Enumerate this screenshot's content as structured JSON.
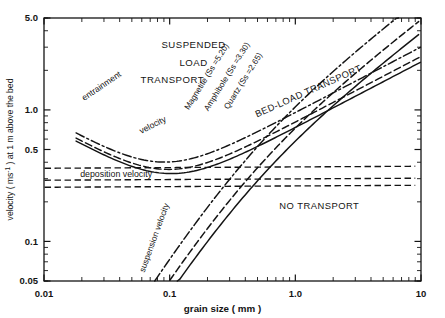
{
  "chart_data": {
    "type": "line",
    "title": "",
    "xlabel": "grain  size  ( mm )",
    "ylabel": "velocity ( ms⁻¹ ) at 1 m above the bed",
    "xscale": "log",
    "yscale": "log",
    "xlim": [
      0.01,
      10
    ],
    "ylim": [
      0.05,
      5.0
    ],
    "xticks": [
      "0.01",
      "0.1",
      "1.0",
      "10"
    ],
    "xtick_values": [
      0.01,
      0.1,
      1.0,
      10
    ],
    "yticks": [
      "5.0",
      "1.0",
      "0.5",
      "0.1",
      "0.05"
    ],
    "ytick_values": [
      5.0,
      1.0,
      0.5,
      0.1,
      0.05
    ],
    "grid": false,
    "legend": "none",
    "annotations": [
      {
        "text": "SUSPENDED",
        "x": 0.17,
        "y": 3.1
      },
      {
        "text": "LOAD",
        "x": 0.17,
        "y": 2.35
      },
      {
        "text": "TRANSPORT",
        "x": 0.11,
        "y": 1.8
      },
      {
        "text": "BED-LOAD TRANSPORT",
        "x": 1.4,
        "y": 1.25
      },
      {
        "text": "NO TRANSPORT",
        "x": 1.5,
        "y": 0.175
      },
      {
        "text": "entrainment",
        "x": 0.026,
        "y": 1.35
      },
      {
        "text": "velocity",
        "x": 0.062,
        "y": 0.72
      },
      {
        "text": "deposition   velocity",
        "x": 0.022,
        "y": 0.3
      },
      {
        "text": "suspension  velocity",
        "x": 0.072,
        "y": 0.105
      }
    ],
    "series": [
      {
        "name": "Magnetite (Ss = 5.20)",
        "label": "Magnetite (Ss =5.20)",
        "style": "dash-dot",
        "kind": "suspension"
      },
      {
        "name": "Amphibole (Ss = 3.30)",
        "label": "Amphibole (Ss =3.30)",
        "style": "dashed",
        "kind": "suspension"
      },
      {
        "name": "Quartz (Ss = 2.65)",
        "label": "Quartz (Ss =2.65)",
        "style": "solid",
        "kind": "suspension"
      },
      {
        "name": "entrainment velocity - magnetite",
        "style": "dash-dot",
        "kind": "entrainment"
      },
      {
        "name": "entrainment velocity - amphibole",
        "style": "dashed",
        "kind": "entrainment"
      },
      {
        "name": "entrainment velocity - quartz",
        "style": "solid",
        "kind": "entrainment"
      },
      {
        "name": "deposition velocity - magnetite",
        "style": "dash-dot",
        "kind": "deposition",
        "y": 0.36
      },
      {
        "name": "deposition velocity - amphibole",
        "style": "dashed",
        "kind": "deposition",
        "y": 0.29
      },
      {
        "name": "deposition velocity - quartz",
        "style": "solid-dashed",
        "kind": "deposition",
        "y": 0.255
      }
    ],
    "curve_labels": [
      {
        "text": "Magnetite (Ss =5.20)",
        "x": 0.195,
        "y": 1.9
      },
      {
        "text": "Amphibole (Ss =3.30)",
        "x": 0.28,
        "y": 1.9
      },
      {
        "text": "Quartz (Ss =2.65)",
        "x": 0.38,
        "y": 1.75
      }
    ]
  },
  "axes": {
    "x_axis_label": "grain  size  ( mm )",
    "y_axis_label": "velocity ( ms",
    "y_axis_label_sup": "-1",
    "y_axis_label_tail": " ) at 1 m above the bed",
    "x_tick_labels": [
      "0.01",
      "0.1",
      "1.0",
      "10"
    ],
    "y_tick_labels": [
      "5.0",
      "1.0",
      "0.5",
      "0.1",
      "0.05"
    ]
  },
  "regions": {
    "suspended_line1": "SUSPENDED",
    "suspended_line2": "LOAD",
    "suspended_line3": "TRANSPORT",
    "bedload": "BED-LOAD TRANSPORT",
    "no_transport": "NO TRANSPORT"
  },
  "curve_text": {
    "entrainment": "entrainment",
    "entrainment_velocity": "velocity",
    "deposition": "deposition   velocity",
    "suspension": "suspension  velocity",
    "magnetite": "Magnetite (Ss =5.20)",
    "amphibole": "Amphibole (Ss =3.30)",
    "quartz": "Quartz (Ss =2.65)"
  }
}
